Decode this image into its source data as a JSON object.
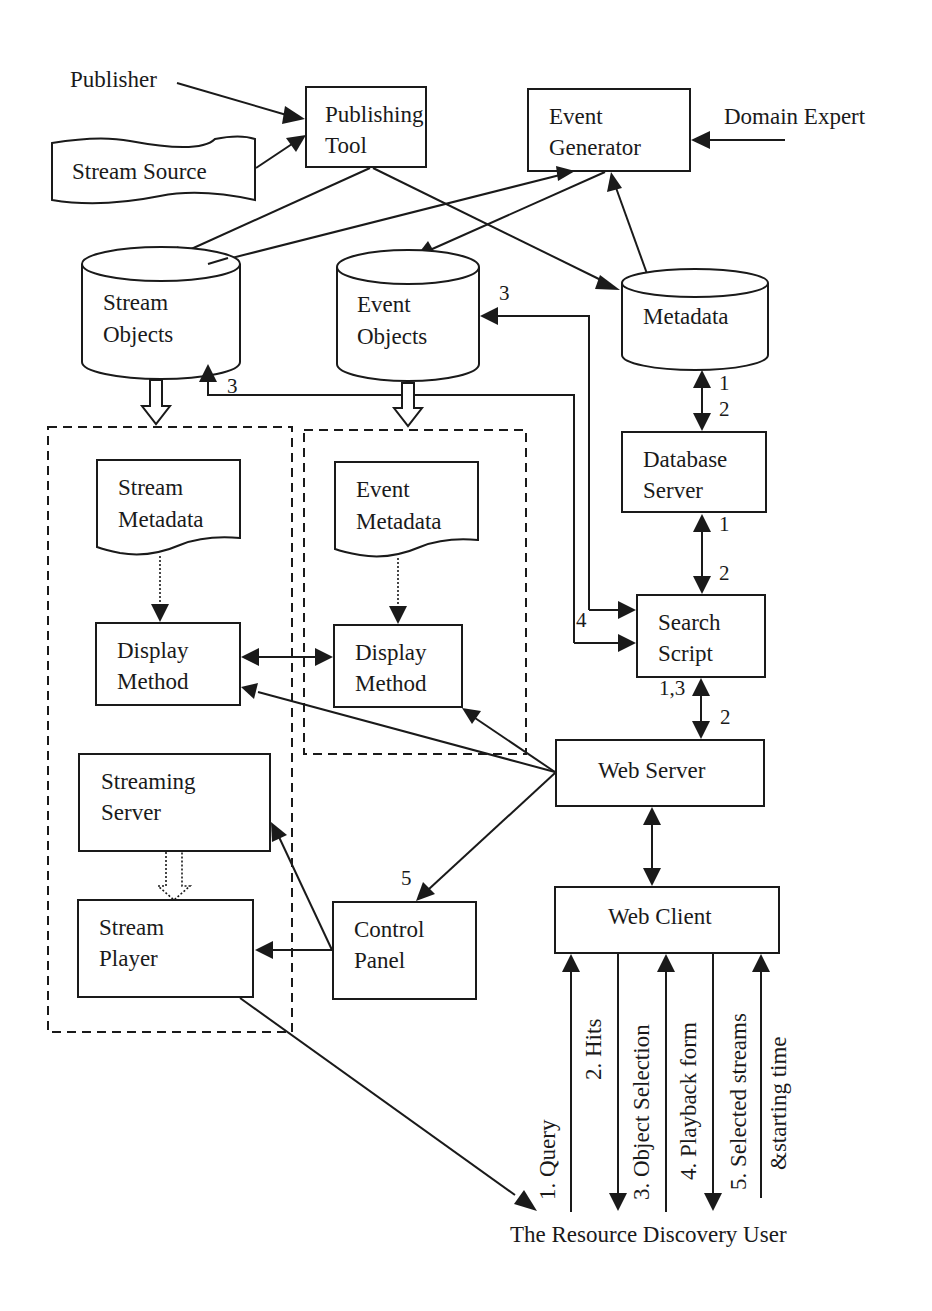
{
  "page_number_partial": "3",
  "actors": {
    "publisher": "Publisher",
    "domain_expert": "Domain Expert",
    "user": "The Resource Discovery User"
  },
  "nodes": {
    "stream_source": "Stream Source",
    "publishing_tool": [
      "Publishing",
      "Tool"
    ],
    "event_generator": [
      "Event",
      "Generator"
    ],
    "stream_objects": [
      "Stream",
      "Objects"
    ],
    "event_objects": [
      "Event",
      "Objects"
    ],
    "metadata": "Metadata",
    "database_server": [
      "Database",
      "Server"
    ],
    "search_script": [
      "Search",
      "Script"
    ],
    "web_server": "Web Server",
    "web_client": "Web Client",
    "stream_metadata": [
      "Stream",
      "Metadata"
    ],
    "event_metadata": [
      "Event",
      "Metadata"
    ],
    "display_method_stream": [
      "Display",
      "Method"
    ],
    "display_method_event": [
      "Display",
      "Method"
    ],
    "streaming_server": [
      "Streaming",
      "Server"
    ],
    "stream_player": [
      "Stream",
      "Player"
    ],
    "control_panel": [
      "Control",
      "Panel"
    ]
  },
  "edge_labels": {
    "event_objects_in": "3",
    "stream_objects_in": "3",
    "metadata_db_up": "1",
    "metadata_db_down": "2",
    "db_search_up": "1",
    "db_search_down": "2",
    "search_in": "4",
    "search_web_up": "1,3",
    "search_web_down": "2",
    "control_panel_in": "5"
  },
  "user_flows": [
    {
      "label": "1. Query",
      "direction": "up"
    },
    {
      "label": "2. Hits",
      "direction": "down"
    },
    {
      "label": "3. Object Selection",
      "direction": "up"
    },
    {
      "label": "4. Playback form",
      "direction": "down"
    },
    {
      "label": "5. Selected streams",
      "label2": "&starting time",
      "direction": "up"
    }
  ],
  "colors": {
    "ink": "#1a1a1a",
    "background": "#ffffff"
  }
}
